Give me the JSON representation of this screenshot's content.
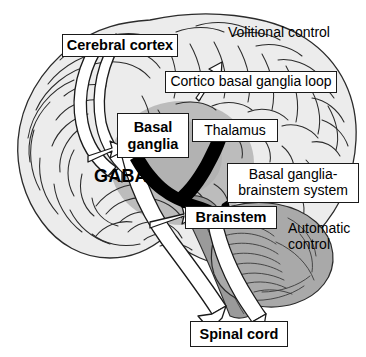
{
  "figure": {
    "type": "anatomical-diagram",
    "background_color": "#ffffff",
    "width": 366,
    "height": 357
  },
  "colors": {
    "cortex_fill": "#ececec",
    "cortex_line": "#2b2b2b",
    "basal_ganglia_fill": "#b9b9b9",
    "cerebellum_fill": "#a9a9a9",
    "brainstem_fill": "#9a9a9a",
    "tract_fill": "#ffffff",
    "tract_outline": "#1a1a1a",
    "gaba_arrow": "#000000",
    "label_border": "#1a1a1a",
    "label_fill": "#ffffff",
    "text": "#000000"
  },
  "labels": {
    "cerebral_cortex": "Cerebral cortex",
    "cortico_loop": "Cortico basal ganglia loop",
    "basal_ganglia": "Basal\nganglia",
    "thalamus": "Thalamus",
    "bg_brainstem_system": "Basal ganglia-\nbrainstem system",
    "brainstem": "Brainstem",
    "spinal_cord": "Spinal cord"
  },
  "annotations": {
    "volitional_control": "Volitional control",
    "automatic_control": "Automatic\ncontrol",
    "gaba": "GABA"
  },
  "arrows": [
    {
      "name": "cortico-basal-ganglia-loop",
      "style": "white-outline",
      "from": "Cerebral cortex",
      "to": "Basal ganglia"
    },
    {
      "name": "gaba-to-thalamus",
      "style": "solid-black",
      "from": "Basal ganglia",
      "to": "Thalamus"
    },
    {
      "name": "gaba-to-brainstem",
      "style": "solid-black",
      "from": "Basal ganglia",
      "to": "Brainstem"
    },
    {
      "name": "cortico-spinal-tract",
      "style": "white-outline",
      "from": "Cerebral cortex",
      "to": "Spinal cord"
    },
    {
      "name": "brainstem-spinal-tract",
      "style": "white-outline",
      "from": "Brainstem",
      "to": "Spinal cord"
    }
  ]
}
